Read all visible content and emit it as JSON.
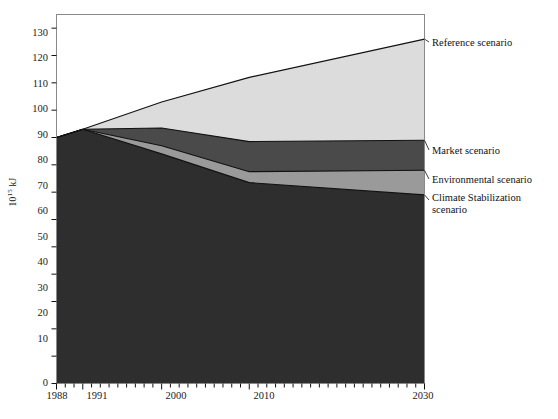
{
  "chart_data": {
    "type": "area",
    "title": "",
    "subtitle": "",
    "xlabel": "",
    "ylabel": "10^15 kJ",
    "ylabel_mantissa": "10",
    "ylabel_exponent": "15",
    "ylabel_unit": " kJ",
    "xlim": [
      1988,
      2030
    ],
    "ylim": [
      0,
      135
    ],
    "grid": false,
    "stacked": true,
    "legend_position": "right-inline-annotations",
    "x": [
      1988,
      1991,
      2000,
      2010,
      2030
    ],
    "xticks": [
      1988,
      1991,
      2000,
      2010,
      2030
    ],
    "xtick_labels": [
      "1988",
      "1991",
      "2000",
      "2010",
      "2030"
    ],
    "xminor_tick_interval": 1,
    "yticks": [
      0,
      10,
      20,
      30,
      40,
      50,
      60,
      70,
      80,
      90,
      100,
      110,
      120,
      130
    ],
    "ytick_labels": [
      "0",
      "10",
      "20",
      "30",
      "40",
      "50",
      "60",
      "70",
      "80",
      "90",
      "100",
      "110",
      "120",
      "130"
    ],
    "series": [
      {
        "name": "Reference scenario",
        "color": "#dcdcdc",
        "values": [
          90,
          93,
          103,
          112,
          126
        ]
      },
      {
        "name": "Market scenario",
        "color": "#4a4a4a",
        "values": [
          90,
          93,
          93.5,
          88.5,
          89
        ]
      },
      {
        "name": "Environmental scenario",
        "color": "#9a9a9a",
        "values": [
          90,
          93,
          87,
          77.5,
          78
        ]
      },
      {
        "name": "Climate Stabilization scenario",
        "color": "#2e2e2e",
        "values": [
          90,
          93,
          84,
          73.5,
          69
        ]
      }
    ],
    "annotations": [
      {
        "label": "Reference scenario",
        "at_x": 2030,
        "at_y": 126
      },
      {
        "label": "Market scenario",
        "at_x": 2030,
        "at_y": 89
      },
      {
        "label": "Environmental scenario",
        "at_x": 2030,
        "at_y": 78
      },
      {
        "label": "Climate Stabilization",
        "at_x": 2030,
        "at_y": 69
      },
      {
        "label": "scenario",
        "at_x": 2030,
        "at_y": 65
      }
    ]
  },
  "legend": {
    "items": [
      {
        "label": "Reference scenario"
      },
      {
        "label": "Market scenario"
      },
      {
        "label": "Environmental scenario"
      },
      {
        "label": "Climate Stabilization"
      },
      {
        "label": "scenario"
      }
    ]
  },
  "axis": {
    "y_title_mantissa": "10",
    "y_title_exponent": "15",
    "y_title_unit": " kJ",
    "y_ticks": [
      "130",
      "120",
      "110",
      "100",
      "90",
      "80",
      "70",
      "60",
      "50",
      "40",
      "30",
      "20",
      "10",
      "0"
    ],
    "x_ticks": [
      "1988",
      "1991",
      "2000",
      "2010",
      "2030"
    ]
  },
  "colors": {
    "reference_band": "#dcdcdc",
    "market_band": "#4a4a4a",
    "environmental_band": "#9a9a9a",
    "climate_band": "#2e2e2e",
    "axis_line": "#8a8a8a",
    "curve_line": "#111111",
    "background": "#ffffff"
  }
}
